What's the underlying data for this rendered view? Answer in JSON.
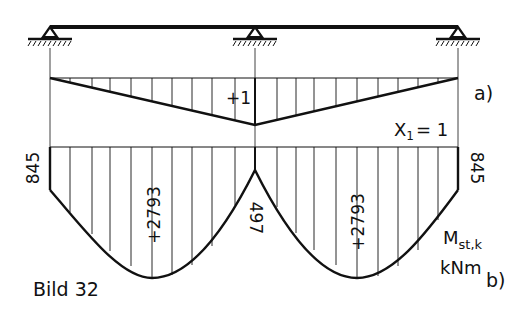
{
  "figure": {
    "caption": "Bild 32",
    "part_a_label": "a)",
    "part_b_label": "b)",
    "unit_load_label": "X",
    "unit_load_subscript": "1",
    "unit_load_value": "= 1",
    "influence_value_label": "+1",
    "moment_symbol": "M",
    "moment_subscript": "st,k",
    "moment_unit": "kNm",
    "left_end_moment": "845",
    "right_end_moment": "845",
    "support_moment": "497",
    "left_span_moment": "+2793",
    "right_span_moment": "+2793"
  },
  "colors": {
    "ink": "#111111",
    "background": "#ffffff"
  }
}
